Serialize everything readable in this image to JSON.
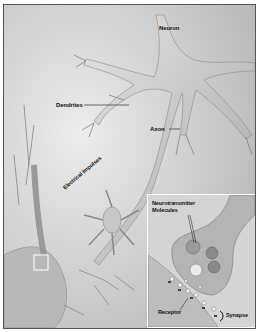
{
  "figure": {
    "labels": {
      "neuron": "Neuron",
      "dendrites": "Dendrites",
      "axon": "Axon",
      "electrical_impulses": "Electrical Impulses",
      "neurotransmitter_line1": "Neurotransmitter",
      "neurotransmitter_line2": "Molecules",
      "receptor": "Receptor",
      "synapse": "Synapse"
    },
    "colors": {
      "background": "#d8d8d8",
      "cell": "#c4c4c4",
      "cell_highlight": "#e6e6e6",
      "label": "#111111",
      "inset_border": "#ffffff"
    }
  }
}
